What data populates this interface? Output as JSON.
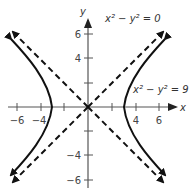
{
  "diagram": {
    "axes": {
      "x_label": "x",
      "y_label": "y",
      "x_ticks": [
        "−6",
        "−4",
        "4",
        "6"
      ],
      "y_ticks": [
        "6",
        "4",
        "−4",
        "−6"
      ]
    },
    "curves": [
      {
        "name": "asymptotes",
        "equation": "x² − y² = 0",
        "style": "dashed"
      },
      {
        "name": "hyperbola",
        "equation": "x² − y² = 9",
        "style": "solid"
      }
    ],
    "labels": {
      "asymptote_eq": "x² − y² = 0",
      "hyperbola_eq": "x² − y² = 9"
    },
    "colors": {
      "curve": "#111111",
      "axis": "#444444"
    }
  }
}
